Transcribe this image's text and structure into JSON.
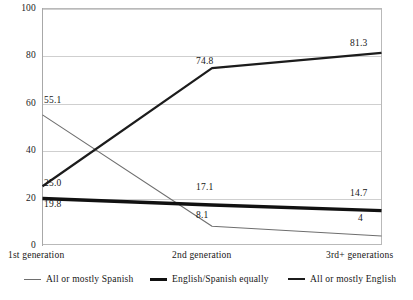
{
  "chart_data": {
    "type": "line",
    "title": "",
    "subtitle": "",
    "xlabel": "",
    "ylabel": "",
    "categories": [
      "1st generation",
      "2nd generation",
      "3rd+ generations"
    ],
    "ylim": [
      0,
      100
    ],
    "yticks": [
      "0",
      "20",
      "40",
      "60",
      "80",
      "100"
    ],
    "grid": true,
    "legend_position": "bottom",
    "series": [
      {
        "name": "All or mostly Spanish",
        "color": "#6e6e6e",
        "width": 1.1,
        "values": [
          55.1,
          8.1,
          4
        ],
        "labels": [
          "55.1",
          "8.1",
          "4"
        ]
      },
      {
        "name": "English/Spanish equally",
        "color": "#111111",
        "width": 3.4,
        "values": [
          19.8,
          17.1,
          14.7
        ],
        "labels": [
          "19.8",
          "17.1",
          "14.7"
        ]
      },
      {
        "name": "All or mostly English",
        "color": "#1c1c1c",
        "width": 2.2,
        "values": [
          25.0,
          74.8,
          81.3
        ],
        "labels": [
          "25.0",
          "74.8",
          "81.3"
        ]
      }
    ]
  },
  "axis": {
    "y_labels": [
      "100",
      "80",
      "60",
      "40",
      "20",
      "0"
    ]
  },
  "legend": {
    "items": [
      {
        "label": "All or mostly Spanish"
      },
      {
        "label": "English/Spanish equally"
      },
      {
        "label": "All or mostly English"
      }
    ]
  },
  "value_labels": [
    {
      "text": "55.1"
    },
    {
      "text": "25.0"
    },
    {
      "text": "19.8"
    },
    {
      "text": "74.8"
    },
    {
      "text": "17.1"
    },
    {
      "text": "8.1"
    },
    {
      "text": "81.3"
    },
    {
      "text": "14.7"
    },
    {
      "text": "4"
    }
  ]
}
